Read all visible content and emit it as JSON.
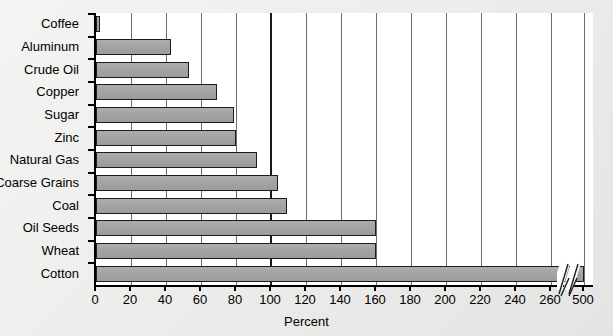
{
  "chart_data": {
    "type": "bar",
    "orientation": "horizontal",
    "title": "",
    "subtitle": "",
    "xlabel": "Percent",
    "ylabel": "",
    "categories": [
      "Coffee",
      "Aluminum",
      "Crude Oil",
      "Copper",
      "Sugar",
      "Zinc",
      "Natural Gas",
      "Coarse Grains",
      "Coal",
      "Oil Seeds",
      "Wheat",
      "Cotton"
    ],
    "values": [
      2,
      43,
      53,
      69,
      79,
      80,
      92,
      104,
      109,
      160,
      160,
      500
    ],
    "xlim": [
      0,
      280
    ],
    "xticks": [
      0,
      20,
      40,
      60,
      80,
      100,
      120,
      140,
      160,
      180,
      200,
      220,
      240,
      260,
      500
    ],
    "xtick_labels": [
      "0",
      "20",
      "40",
      "60",
      "80",
      "100",
      "120",
      "140",
      "160",
      "180",
      "200",
      "220",
      "240",
      "260",
      "500"
    ],
    "axis_break": {
      "after_value": 260,
      "resumes_at": 500,
      "style": "double-slash"
    },
    "grid": "vertical",
    "grid_emphasis_value": 100,
    "legend": null,
    "bar_color": "#a6a6a6",
    "bar_edge_color": "#1c1c1c",
    "axis_color": "#000000",
    "plot_background": "#ffffff",
    "figure_background": "#eeeeec"
  }
}
